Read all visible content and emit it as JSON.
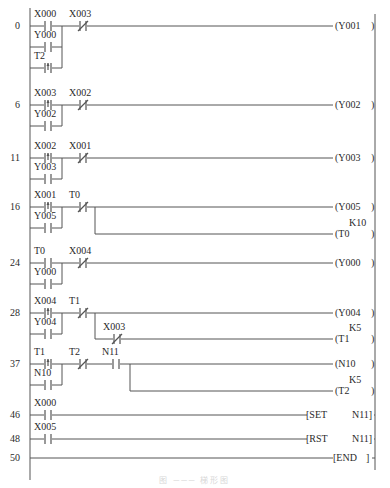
{
  "diagram": {
    "type": "PLC ladder diagram",
    "left_rail_x": 30,
    "right_rail_x": 375,
    "line_color": "#555555",
    "caption": "图 ─── 梯形图"
  },
  "rungs": [
    {
      "step": "0",
      "y": 26,
      "contacts": [
        {
          "label": "X000",
          "type": "NO",
          "x": 44,
          "row": 0
        },
        {
          "label": "Y000",
          "type": "NO",
          "x": 44,
          "row": 1
        },
        {
          "label": "T2",
          "type": "P",
          "x": 44,
          "row": 2
        },
        {
          "label": "X003",
          "type": "NC",
          "x": 79,
          "row": 0
        }
      ],
      "outputs": [
        {
          "text": "(Y001",
          "close": ")",
          "y_offset": 0
        }
      ]
    },
    {
      "step": "6",
      "y": 105,
      "contacts": [
        {
          "label": "X003",
          "type": "P",
          "x": 44,
          "row": 0
        },
        {
          "label": "Y002",
          "type": "NO",
          "x": 44,
          "row": 1
        },
        {
          "label": "X002",
          "type": "NC",
          "x": 79,
          "row": 0
        }
      ],
      "outputs": [
        {
          "text": "(Y002",
          "close": ")",
          "y_offset": 0
        }
      ]
    },
    {
      "step": "11",
      "y": 158,
      "contacts": [
        {
          "label": "X002",
          "type": "P",
          "x": 44,
          "row": 0
        },
        {
          "label": "Y003",
          "type": "NO",
          "x": 44,
          "row": 1
        },
        {
          "label": "X001",
          "type": "NC",
          "x": 79,
          "row": 0
        }
      ],
      "outputs": [
        {
          "text": "(Y003",
          "close": ")",
          "y_offset": 0
        }
      ]
    },
    {
      "step": "16",
      "y": 207,
      "contacts": [
        {
          "label": "X001",
          "type": "P",
          "x": 44,
          "row": 0
        },
        {
          "label": "Y005",
          "type": "NO",
          "x": 44,
          "row": 1
        },
        {
          "label": "T0",
          "type": "NC",
          "x": 79,
          "row": 0
        }
      ],
      "outputs": [
        {
          "text": "(Y005",
          "close": ")",
          "y_offset": 0
        },
        {
          "text": "(T0",
          "close": ")",
          "setting": "K10",
          "y_offset": 27
        }
      ]
    },
    {
      "step": "24",
      "y": 263,
      "contacts": [
        {
          "label": "T0",
          "type": "NO",
          "x": 44,
          "row": 0
        },
        {
          "label": "Y000",
          "type": "NO",
          "x": 44,
          "row": 1
        },
        {
          "label": "X004",
          "type": "NC",
          "x": 79,
          "row": 0
        }
      ],
      "outputs": [
        {
          "text": "(Y000",
          "close": ")",
          "y_offset": 0
        }
      ]
    },
    {
      "step": "28",
      "y": 313,
      "contacts": [
        {
          "label": "X004",
          "type": "P",
          "x": 44,
          "row": 0
        },
        {
          "label": "Y004",
          "type": "NO",
          "x": 44,
          "row": 1
        },
        {
          "label": "T1",
          "type": "NC",
          "x": 79,
          "row": 0
        },
        {
          "label": "X003",
          "type": "NC",
          "x": 113,
          "row": 1
        }
      ],
      "outputs": [
        {
          "text": "(Y004",
          "close": ")",
          "y_offset": 0
        },
        {
          "text": "(T1",
          "close": ")",
          "setting": "K5",
          "y_offset": 26
        }
      ]
    },
    {
      "step": "37",
      "y": 364,
      "contacts": [
        {
          "label": "T1",
          "type": "P",
          "x": 44,
          "row": 0
        },
        {
          "label": "N10",
          "type": "NO",
          "x": 44,
          "row": 1
        },
        {
          "label": "T2",
          "type": "NC",
          "x": 79,
          "row": 0
        },
        {
          "label": "N11",
          "type": "NO",
          "x": 112,
          "row": 0
        }
      ],
      "outputs": [
        {
          "text": "(N10",
          "close": ")",
          "y_offset": 0
        },
        {
          "text": "(T2",
          "close": ")",
          "setting": "K5",
          "y_offset": 27
        }
      ]
    },
    {
      "step": "46",
      "y": 415,
      "contacts": [
        {
          "label": "X000",
          "type": "NO",
          "x": 44,
          "row": 0
        }
      ],
      "outputs": [
        {
          "instr": "[SET",
          "operand": "N11]",
          "y_offset": 0
        }
      ]
    },
    {
      "step": "48",
      "y": 439,
      "contacts": [
        {
          "label": "X005",
          "type": "NO",
          "x": 44,
          "row": 0
        }
      ],
      "outputs": [
        {
          "instr": "[RST",
          "operand": "N11]",
          "y_offset": 0
        }
      ]
    },
    {
      "step": "50",
      "y": 458,
      "contacts": [],
      "outputs": [
        {
          "instr": "[END",
          "operand": "]",
          "y_offset": 0
        }
      ]
    }
  ]
}
